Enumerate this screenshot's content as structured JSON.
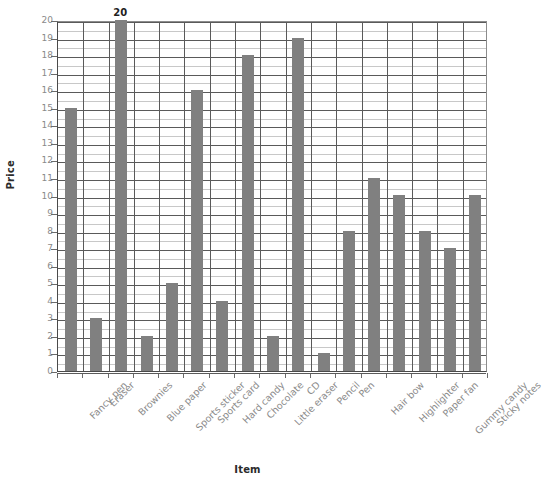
{
  "chart_data": {
    "type": "bar",
    "title": "",
    "xlabel": "Item",
    "ylabel": "Price",
    "ylim": [
      0,
      20
    ],
    "yticks": [
      0,
      1,
      2,
      3,
      4,
      5,
      6,
      7,
      8,
      9,
      10,
      11,
      12,
      13,
      14,
      15,
      16,
      17,
      18,
      19,
      20
    ],
    "grid": true,
    "minor_grid": true,
    "legend": "none",
    "bar_color": "#808080",
    "label_color": "#8a8a8a",
    "value_label_color": "#1f1f1f",
    "axis_title_color": "#2b2b2b",
    "categories": [
      "Fancy pen",
      "Eraser",
      "Brownies",
      "Blue paper",
      "Sports sticker",
      "Sports card",
      "Hard candy",
      "Chocolate",
      "Little eraser",
      "CD",
      "Pencil",
      "Pen",
      "Hair bow",
      "Highlighter",
      "Paper fan",
      "Gummy candy",
      "Sticky notes"
    ],
    "values": [
      15,
      3,
      20,
      2,
      5,
      16,
      4,
      18,
      2,
      19,
      1,
      8,
      11,
      10,
      8,
      7,
      10
    ],
    "value_labels": [
      "15",
      "3",
      "20",
      "2",
      "5",
      "16",
      "4",
      "18",
      "2",
      "19",
      "1",
      "8",
      "11",
      "10",
      "8",
      "7",
      "10"
    ]
  }
}
